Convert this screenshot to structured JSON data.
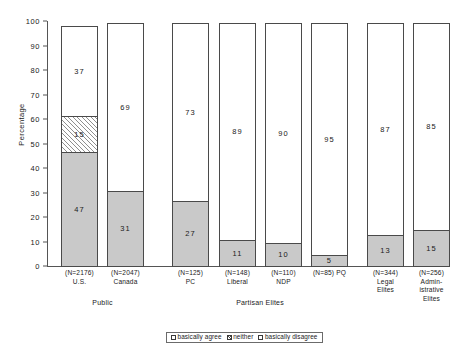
{
  "chart_data": {
    "type": "bar",
    "subtype": "stacked-bar",
    "title": "",
    "xlabel": "",
    "ylabel": "Percentage",
    "ylim": [
      0,
      100
    ],
    "ytick_step": 10,
    "yticks": [
      "100",
      "90",
      "80",
      "70",
      "60",
      "50",
      "40",
      "30",
      "20",
      "10",
      "0"
    ],
    "grid": false,
    "legend_position": "bottom-center",
    "categories": [
      "U.S.",
      "Canada",
      "PC",
      "Liberal",
      "NDP",
      "PQ",
      "Legal Elites",
      "Administrative Elites"
    ],
    "sample_sizes": [
      "(N=2176)",
      "(N=2047)",
      "(N=125)",
      "(N=148)",
      "(N=110)",
      "(N=85)",
      "(N=344)",
      "(N=256)"
    ],
    "groups": [
      {
        "label": "Public",
        "categories": [
          "U.S.",
          "Canada"
        ]
      },
      {
        "label": "Partisan Elites",
        "categories": [
          "PC",
          "Liberal",
          "NDP",
          "PQ"
        ]
      },
      {
        "label": "",
        "categories": [
          "Legal Elites",
          "Administrative Elites"
        ]
      }
    ],
    "series": [
      {
        "name": "basically agree",
        "values": [
          47,
          31,
          27,
          11,
          10,
          5,
          13,
          15
        ]
      },
      {
        "name": "neither",
        "values": [
          15,
          0,
          0,
          0,
          0,
          0,
          0,
          0
        ]
      },
      {
        "name": "basically disagree",
        "values": [
          37,
          69,
          73,
          89,
          90,
          95,
          87,
          85
        ]
      }
    ],
    "colors": {
      "basically agree": "#c9c9c9",
      "neither": "hatched",
      "basically disagree": "#ffffff",
      "outline": "#4a4a4a",
      "axis": "#555555",
      "text": "#1a1a1a"
    }
  },
  "axis": {
    "y_title": "Percentage",
    "ticks": [
      "100",
      "90",
      "80",
      "70",
      "60",
      "50",
      "40",
      "30",
      "20",
      "10",
      "0"
    ]
  },
  "bars": [
    {
      "name": "U.S.",
      "n": "(N=2176)",
      "label_lines": [
        "(N=2176)",
        "U.S."
      ],
      "segments": [
        {
          "key": "agree",
          "value": 47,
          "text": "47"
        },
        {
          "key": "neither",
          "value": 15,
          "text": "15"
        },
        {
          "key": "disagree",
          "value": 37,
          "text": "37"
        }
      ]
    },
    {
      "name": "Canada",
      "n": "(N=2047)",
      "label_lines": [
        "(N=2047)",
        "Canada"
      ],
      "segments": [
        {
          "key": "agree",
          "value": 31,
          "text": "31"
        },
        {
          "key": "disagree",
          "value": 69,
          "text": "69"
        }
      ]
    },
    {
      "name": "PC",
      "n": "(N=125)",
      "label_lines": [
        "(N=125)",
        "PC"
      ],
      "segments": [
        {
          "key": "agree",
          "value": 27,
          "text": "27"
        },
        {
          "key": "disagree",
          "value": 73,
          "text": "73"
        }
      ]
    },
    {
      "name": "Liberal",
      "n": "(N=148)",
      "label_lines": [
        "(N=148)",
        "Liberal"
      ],
      "segments": [
        {
          "key": "agree",
          "value": 11,
          "text": "11"
        },
        {
          "key": "disagree",
          "value": 89,
          "text": "89"
        }
      ]
    },
    {
      "name": "NDP",
      "n": "(N=110)",
      "label_lines": [
        "(N=110)",
        "NDP"
      ],
      "segments": [
        {
          "key": "agree",
          "value": 10,
          "text": "10"
        },
        {
          "key": "disagree",
          "value": 90,
          "text": "90"
        }
      ]
    },
    {
      "name": "PQ",
      "n": "(N=85)",
      "label_lines": [
        "(N=85) PQ",
        ""
      ],
      "segments": [
        {
          "key": "agree",
          "value": 5,
          "text": "5"
        },
        {
          "key": "disagree",
          "value": 95,
          "text": "95"
        }
      ]
    },
    {
      "name": "Legal Elites",
      "n": "(N=344)",
      "label_lines": [
        "(N=344)",
        "Legal",
        "Elites"
      ],
      "segments": [
        {
          "key": "agree",
          "value": 13,
          "text": "13"
        },
        {
          "key": "disagree",
          "value": 87,
          "text": "87"
        }
      ]
    },
    {
      "name": "Administrative Elites",
      "n": "(N=256)",
      "label_lines": [
        "(N=256)",
        "Admin-",
        "istrative",
        "Elites"
      ],
      "segments": [
        {
          "key": "agree",
          "value": 15,
          "text": "15"
        },
        {
          "key": "disagree",
          "value": 85,
          "text": "85"
        }
      ]
    }
  ],
  "x_labels": [
    {
      "l1": "(N=2176)",
      "l2": "U.S.",
      "l3": "",
      "l4": ""
    },
    {
      "l1": "(N=2047)",
      "l2": "Canada",
      "l3": "",
      "l4": ""
    },
    {
      "l1": "(N=125)",
      "l2": "PC",
      "l3": "",
      "l4": ""
    },
    {
      "l1": "(N=148)",
      "l2": "Liberal",
      "l3": "",
      "l4": ""
    },
    {
      "l1": "(N=110)",
      "l2": "NDP",
      "l3": "",
      "l4": ""
    },
    {
      "l1": "(N=85) PQ",
      "l2": "",
      "l3": "",
      "l4": ""
    },
    {
      "l1": "(N=344)",
      "l2": "Legal",
      "l3": "Elites",
      "l4": ""
    },
    {
      "l1": "(N=256)",
      "l2": "Admin-",
      "l3": "istrative",
      "l4": "Elites"
    }
  ],
  "group_labels": [
    {
      "text": "Public"
    },
    {
      "text": "Partisan Elites"
    }
  ],
  "legend": {
    "items": [
      {
        "key": "agree",
        "label": "basically agree",
        "swatch": "open-square"
      },
      {
        "key": "neither",
        "label": "neither",
        "swatch": "hatched-square"
      },
      {
        "key": "disagree",
        "label": "basically disagree",
        "swatch": "open-square"
      }
    ]
  }
}
